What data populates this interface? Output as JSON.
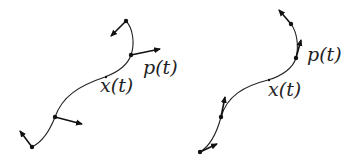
{
  "diagram": {
    "panels": [
      {
        "name": "left",
        "curve_label": "x(t)",
        "vector_label": "p(t)",
        "note": "vectors roughly normal to the curve"
      },
      {
        "name": "right",
        "curve_label": "x(t)",
        "vector_label": "p(t)",
        "note": "vectors roughly tangent to the curve"
      }
    ],
    "colors": {
      "stroke": "#222222",
      "background": "#ffffff"
    }
  }
}
